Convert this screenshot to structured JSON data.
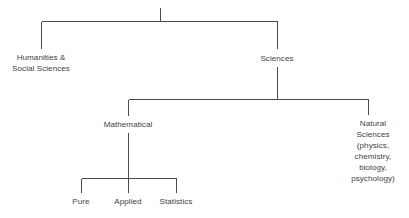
{
  "diagram": {
    "type": "tree",
    "orientation": "top-down",
    "stroke_color": "#4a4a4a",
    "text_color": "#3f3f3f",
    "background_color": "#ffffff",
    "root": {
      "label": "",
      "note": "unlabeled root stem"
    },
    "nodes": {
      "humanities": {
        "label": "Humanities &\nSocial Sciences",
        "level": 1
      },
      "sciences": {
        "label": "Sciences",
        "level": 1
      },
      "mathematical": {
        "label": "Mathematical",
        "level": 2
      },
      "natural_sciences": {
        "label": "Natural\nSciences\n(physics,\nchemistry,\nbiology,\npsychology)",
        "level": 2
      },
      "pure": {
        "label": "Pure",
        "level": 3
      },
      "applied": {
        "label": "Applied",
        "level": 3
      },
      "statistics": {
        "label": "Statistics",
        "level": 3
      }
    },
    "edges": [
      {
        "from": "root",
        "to": "humanities"
      },
      {
        "from": "root",
        "to": "sciences"
      },
      {
        "from": "sciences",
        "to": "mathematical"
      },
      {
        "from": "sciences",
        "to": "natural_sciences"
      },
      {
        "from": "mathematical",
        "to": "pure"
      },
      {
        "from": "mathematical",
        "to": "applied"
      },
      {
        "from": "mathematical",
        "to": "statistics"
      }
    ]
  }
}
